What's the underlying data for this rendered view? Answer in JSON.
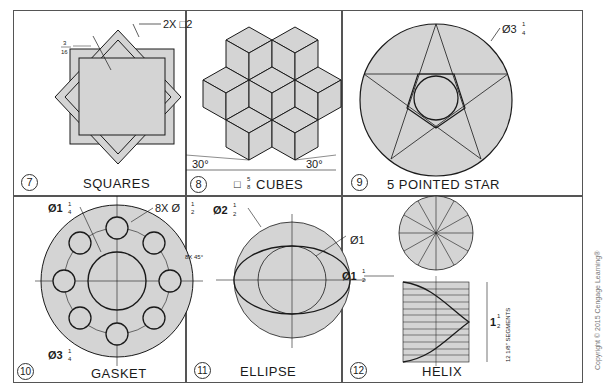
{
  "figure": {
    "panels": [
      {
        "number": "7",
        "title": "SQUARES",
        "dimensions": {
          "count_size": "2X □2",
          "thickness_num": "3",
          "thickness_den": "16"
        }
      },
      {
        "number": "8",
        "title": "CUBES",
        "dimensions": {
          "size_symbol": "□",
          "size_num": "5",
          "size_den": "8",
          "angle_left": "30°",
          "angle_right": "30°"
        }
      },
      {
        "number": "9",
        "title": "5 POINTED STAR",
        "dimensions": {
          "diameter_whole": "Ø3",
          "diameter_num": "1",
          "diameter_den": "4"
        }
      },
      {
        "number": "10",
        "title": "GASKET",
        "dimensions": {
          "inner_diameter_whole": "Ø1",
          "inner_diameter_num": "1",
          "inner_diameter_den": "4",
          "holes_prefix": "8X Ø",
          "holes_num": "1",
          "holes_den": "2",
          "angle": "8X 45°",
          "outer_diameter_whole": "Ø3",
          "outer_diameter_num": "1",
          "outer_diameter_den": "4"
        }
      },
      {
        "number": "11",
        "title": "ELLIPSE",
        "dimensions": {
          "outer_whole": "Ø2",
          "outer_num": "1",
          "outer_den": "2",
          "inner": "Ø1"
        }
      },
      {
        "number": "12",
        "title": "HELIX",
        "dimensions": {
          "diameter_whole": "Ø1",
          "diameter_num": "1",
          "diameter_den": "2",
          "height_whole": "1",
          "height_num": "1",
          "height_den": "2",
          "segments": "12  1/8\" SEGMENTS",
          "circle_labels": [
            "1",
            "2",
            "3",
            "4",
            "5",
            "6",
            "7",
            "8",
            "9",
            "10",
            "11",
            "12"
          ],
          "row_labels": [
            "1",
            "2",
            "3",
            "4",
            "5",
            "6",
            "7",
            "8",
            "9",
            "10",
            "11",
            "12",
            "1"
          ]
        }
      }
    ],
    "copyright": "Copyright © 2015 Cengage Learning®"
  },
  "colors": {
    "fill": "#d4d4d4",
    "line": "#1a1a1a",
    "border": "#555555"
  }
}
